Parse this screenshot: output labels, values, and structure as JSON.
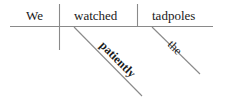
{
  "diagram": {
    "type": "Reed-Kellogg sentence diagram",
    "sentence": "We watched the tadpoles patiently",
    "subject": "We",
    "verb": "watched",
    "object": "tadpoles",
    "modifiers": [
      {
        "word": "patiently",
        "modifies": "watched",
        "role": "adverb"
      },
      {
        "word": "the",
        "modifies": "tadpoles",
        "role": "article"
      }
    ],
    "colors": {
      "line": "#8a8a8a",
      "text": "#1a1a1a",
      "background": "#ffffff"
    }
  }
}
